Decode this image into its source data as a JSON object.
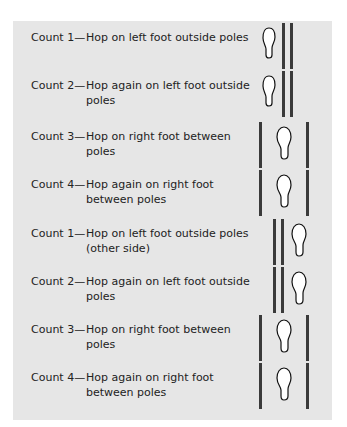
{
  "colors": {
    "panel": "#e6e6e6",
    "pole": "#3a3a3a",
    "text": "#222222"
  },
  "rows": [
    {
      "count": "Count 1—",
      "desc": "Hop on left foot outside poles",
      "layout": "foot-left-double-poles-right"
    },
    {
      "count": "Count 2—",
      "desc": "Hop again on left foot outside poles",
      "layout": "foot-left-double-poles-right"
    },
    {
      "count": "Count 3—",
      "desc": "Hop on right foot between poles",
      "layout": "foot-between-poles"
    },
    {
      "count": "Count 4—",
      "desc": "Hop again on right foot between poles",
      "layout": "foot-between-poles"
    },
    {
      "count": "Count 1—",
      "desc": "Hop on left foot outside poles (other side)",
      "layout": "double-poles-left-foot-right"
    },
    {
      "count": "Count 2—",
      "desc": "Hop again on left foot outside poles",
      "layout": "double-poles-left-foot-right"
    },
    {
      "count": "Count 3—",
      "desc": "Hop on right foot between poles",
      "layout": "foot-between-poles"
    },
    {
      "count": "Count 4—",
      "desc": "Hop again on right foot between poles",
      "layout": "foot-between-poles"
    }
  ]
}
